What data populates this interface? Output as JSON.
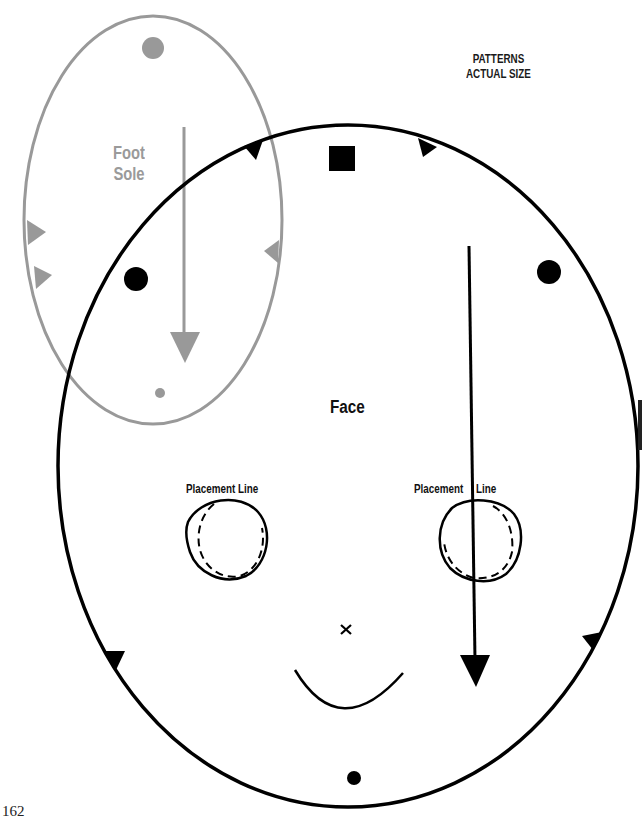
{
  "header": {
    "line1": "PATTERNS",
    "line2": "ACTUAL SIZE"
  },
  "patterns": {
    "foot_sole": {
      "label_line1": "Foot",
      "label_line2": "Sole",
      "stroke_color": "#999999"
    },
    "face": {
      "label": "Face",
      "stroke_color": "#000000"
    }
  },
  "placement_labels": {
    "left": "Placement Line",
    "right_part1": "Placement",
    "right_part2": "Line"
  },
  "page_number": "162"
}
